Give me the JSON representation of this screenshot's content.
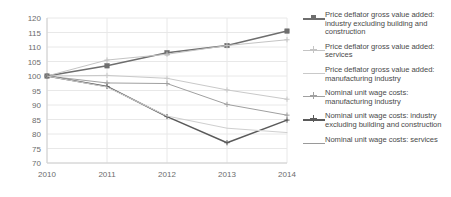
{
  "chart_data": {
    "type": "line",
    "title": "",
    "subtitle": "",
    "xlabel": "",
    "ylabel": "",
    "x": [
      "2010",
      "2011",
      "2012",
      "2013",
      "2014"
    ],
    "categories": [
      "2010",
      "2011",
      "2012",
      "2013",
      "2014"
    ],
    "ylim": [
      70,
      120
    ],
    "yticks": [
      70,
      75,
      80,
      85,
      90,
      95,
      100,
      105,
      110,
      115,
      120
    ],
    "grid": true,
    "legend_position": "right",
    "series": [
      {
        "name": "Price deflator gross value added: industry excluding building and construction",
        "values": [
          100,
          103.5,
          108,
          110.5,
          115.5
        ],
        "color": "#6e6e6e",
        "marker": "square"
      },
      {
        "name": "Price deflator gross value added: services",
        "values": [
          100,
          105.5,
          107.5,
          110.5,
          112.5
        ],
        "color": "#c4c4c4",
        "marker": "plus"
      },
      {
        "name": "Price deflator gross value added: manufacturing industry",
        "values": [
          100,
          100.2,
          99.2,
          95.2,
          92
        ],
        "color": "#c9c9c9",
        "marker": "plus"
      },
      {
        "name": "Nominal unit wage costs: manufacturing industry",
        "values": [
          100,
          97.6,
          97.4,
          90.2,
          86.5
        ],
        "color": "#a0a0a0",
        "marker": "plus"
      },
      {
        "name": "Nominal unit wage costs: industry excluding building and construction",
        "values": [
          100,
          96.4,
          86,
          77,
          84.8
        ],
        "color": "#5a5a5a",
        "marker": "plus"
      },
      {
        "name": "Nominal unit wage costs: services",
        "values": [
          100,
          96.2,
          86.2,
          82,
          80.5
        ],
        "color": "#cfcfcf",
        "marker": "none"
      }
    ]
  },
  "legend": {
    "items": [
      {
        "label": "Price deflator gross value added: industry excluding building and construction",
        "color": "#6e6e6e",
        "marker": "square"
      },
      {
        "label": "Price deflator gross value added: services",
        "color": "#c4c4c4",
        "marker": "plus"
      },
      {
        "label": "Price deflator gross value added: manufacturing industry",
        "color": "#c9c9c9",
        "marker": "none"
      },
      {
        "label": "Nominal unit wage costs: manufacturing industry",
        "color": "#a0a0a0",
        "marker": "plus"
      },
      {
        "label": "Nominal unit wage costs: industry excluding building and construction",
        "color": "#5a5a5a",
        "marker": "plus"
      },
      {
        "label": "Nominal unit wage costs: services",
        "color": "#9a9a9a",
        "marker": "none"
      }
    ]
  },
  "axes": {
    "y_tick_labels": [
      "120",
      "115",
      "110",
      "105",
      "100",
      "95",
      "90",
      "85",
      "80",
      "75",
      "70"
    ],
    "x_tick_labels": [
      "2010",
      "2011",
      "2012",
      "2013",
      "2014"
    ]
  },
  "colors": {
    "grid": "#e8e8e8",
    "axis_text": "#6b6b6b",
    "background": "#ffffff"
  }
}
